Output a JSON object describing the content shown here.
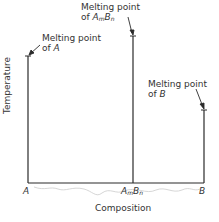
{
  "diagram": {
    "type": "phase-diagram",
    "y_axis_label": "Temperature",
    "x_axis_label": "Composition",
    "x_ticks": {
      "left": "A",
      "middle_a": "A",
      "middle_a_sub": "m",
      "middle_b": "B",
      "middle_b_sub": "n",
      "right": "B"
    },
    "annotations": {
      "a": {
        "line1": "Melting point",
        "line2_prefix": "of ",
        "line2_var": "A"
      },
      "ambn": {
        "line1": "Melting point",
        "line2_prefix": "of ",
        "var_a": "A",
        "sub_m": "m",
        "var_b": "B",
        "sub_n": "n"
      },
      "b": {
        "line1": "Melting point",
        "line2_prefix": "of ",
        "line2_var": "B"
      }
    },
    "colors": {
      "line": "#2a2a2a",
      "background": "#ffffff"
    }
  }
}
